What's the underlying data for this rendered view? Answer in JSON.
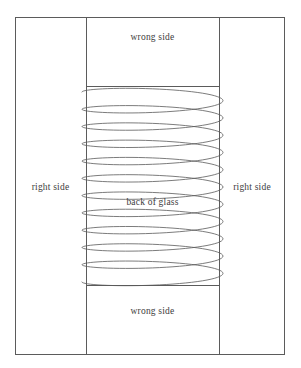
{
  "figure": {
    "background_color": "#ffffff",
    "line_color": "#5b5b5b",
    "text_color": "#3d3d3d"
  },
  "labels": {
    "top_wrong_side": "wrong side",
    "bottom_wrong_side": "wrong side",
    "left_right_side": "right side",
    "right_right_side": "right side",
    "back_of_glass": "back of glass"
  },
  "chart_data": {
    "type": "diagram",
    "xlabel": "",
    "ylabel": "",
    "xlim": [
      0,
      301
    ],
    "ylim": [
      0,
      368
    ],
    "grid": false,
    "legend": "none",
    "outer_rectangle": {
      "x": 15,
      "y": 17,
      "width": 270,
      "height": 338,
      "stroke": "#5b5b5b",
      "fill": "none"
    },
    "vertical_fold_lines": [
      {
        "name": "left-fold-line",
        "x": 86,
        "y1": 17,
        "y2": 355
      },
      {
        "name": "right-fold-line",
        "x": 219,
        "y1": 17,
        "y2": 355
      }
    ],
    "horizontal_seam_lines": [
      {
        "name": "top-seam-line",
        "y": 86,
        "x1": 86,
        "x2": 219
      },
      {
        "name": "bottom-seam-line",
        "y": 285,
        "x1": 86,
        "x2": 219
      }
    ],
    "coil": {
      "name": "coiled-thread",
      "loops": 11,
      "x_left": 82,
      "x_right": 223,
      "y_start": 92,
      "y_end": 282,
      "loop_pitch": 17.3,
      "ellipse_half_height": 7.5,
      "stroke": "#5b5b5b",
      "stroke_width": 0.8
    },
    "panels": [
      {
        "name": "left-panel",
        "label": "right side",
        "x_range": [
          15,
          86
        ]
      },
      {
        "name": "center-panel-top",
        "label": "wrong side",
        "y_range": [
          17,
          86
        ]
      },
      {
        "name": "center-panel-middle",
        "label": "back of glass",
        "y_range": [
          86,
          285
        ]
      },
      {
        "name": "center-panel-bottom",
        "label": "wrong side",
        "y_range": [
          285,
          355
        ]
      },
      {
        "name": "right-panel",
        "label": "right side",
        "x_range": [
          219,
          285
        ]
      }
    ]
  }
}
